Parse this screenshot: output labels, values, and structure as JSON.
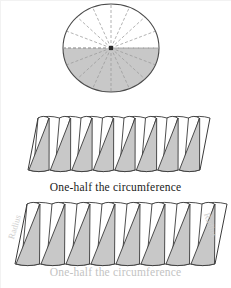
{
  "figure": {
    "title_semantic": "circle-area-derivation-diagram",
    "colors": {
      "wedge_fill_gray": "#c8c8c8",
      "wedge_fill_white": "#ffffff",
      "outline": "#3a3a3a",
      "circle_outline": "#4a4a4a",
      "sector_line": "#9a9a9a",
      "shaded_half": "#c8c8c8",
      "caption_dark": "#1a1a1a",
      "caption_light": "#c3c3c3",
      "radius_label": "#cfcfcf",
      "background": "#ffffff"
    },
    "circle": {
      "name": "sectored-circle",
      "center_x": 111,
      "center_y": 48,
      "radius_x": 48,
      "radius_y": 44,
      "sector_count": 16,
      "shaded_half": "bottom",
      "center_dot": true,
      "radial_line_style": "dashed"
    },
    "middle_strip": {
      "name": "rearranged-wedges-small",
      "wedge_pairs": 8,
      "left": 28,
      "top": 118,
      "width": 172,
      "height": 52,
      "shear_px": 10
    },
    "bottom_strip": {
      "name": "rearranged-wedges-large",
      "wedge_pairs": 8,
      "left": 15,
      "top": 204,
      "width": 200,
      "height": 60,
      "shear_px": 12
    }
  },
  "labels": {
    "caption_middle": "One-half the circumference",
    "caption_bottom": "One-half the circumference",
    "radius_left": "Radius",
    "radius_right": "Radius"
  }
}
